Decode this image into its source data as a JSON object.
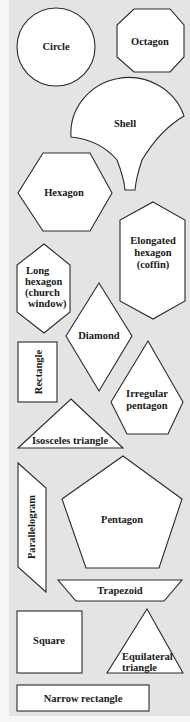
{
  "diagram": {
    "title": "",
    "background": "#e4e4e4",
    "shape_fill": "#ffffff",
    "stroke": "#2a2a2a",
    "shapes": [
      {
        "id": "circle",
        "label": "Circle"
      },
      {
        "id": "octagon",
        "label": "Octagon"
      },
      {
        "id": "shell",
        "label": "Shell"
      },
      {
        "id": "hexagon",
        "label": "Hexagon"
      },
      {
        "id": "elongated-hexagon",
        "label_lines": [
          "Elongated",
          "hexagon",
          "(coffin)"
        ]
      },
      {
        "id": "long-hexagon",
        "label_lines": [
          "Long",
          "hexagon",
          "(church",
          "window)"
        ]
      },
      {
        "id": "diamond",
        "label": "Diamond"
      },
      {
        "id": "rectangle",
        "label": "Rectangle"
      },
      {
        "id": "irregular-pentagon",
        "label_lines": [
          "Irregular",
          "pentagon"
        ]
      },
      {
        "id": "isosceles-triangle",
        "label": "Isosceles triangle"
      },
      {
        "id": "parallelogram",
        "label": "Parallelogram"
      },
      {
        "id": "pentagon",
        "label": "Pentagon"
      },
      {
        "id": "trapezoid",
        "label": "Trapezoid"
      },
      {
        "id": "square",
        "label": "Square"
      },
      {
        "id": "equilateral-triangle",
        "label_lines": [
          "Equilateral",
          "triangle"
        ]
      },
      {
        "id": "narrow-rectangle",
        "label": "Narrow rectangle"
      }
    ]
  }
}
